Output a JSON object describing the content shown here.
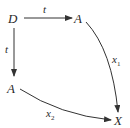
{
  "diagram": {
    "nodes": {
      "top_left": "D",
      "top_right": "A",
      "bottom_left": "A",
      "bottom_right": "X"
    },
    "edges": {
      "top": {
        "label": "t",
        "from": "D",
        "to": "A (top)"
      },
      "left": {
        "label": "t",
        "from": "D",
        "to": "A (left)"
      },
      "right": {
        "label": "x",
        "subscript": "1",
        "from": "A (top)",
        "to": "X"
      },
      "bottom": {
        "label": "x",
        "subscript": "2",
        "from": "A (left)",
        "to": "X"
      }
    }
  }
}
